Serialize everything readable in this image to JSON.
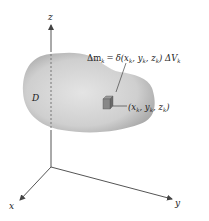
{
  "diagram": {
    "region_label": "D",
    "axes": {
      "x_label": "x",
      "y_label": "y",
      "z_label": "z"
    },
    "mass_element": {
      "formula_lhs": "Δm",
      "formula_lhs_sub": "k",
      "formula_eq": "=",
      "formula_rhs_prefix": "δ(x",
      "formula_rhs_sub1": "k",
      "formula_rhs_mid1": ", y",
      "formula_rhs_sub2": "k",
      "formula_rhs_mid2": ", z",
      "formula_rhs_sub3": "k",
      "formula_rhs_suffix": ") ΔV",
      "formula_rhs_sub4": "k"
    },
    "point": {
      "prefix": "(x",
      "sub1": "k",
      "mid1": ", y",
      "sub2": "k",
      "mid2": ", z",
      "sub3": "k",
      "suffix": ")"
    },
    "colors": {
      "solid_fill_center": "#dcdcdc",
      "solid_fill_edge": "#a8a8a8",
      "axis": "#555555",
      "cube": "#7a7a7a"
    }
  }
}
